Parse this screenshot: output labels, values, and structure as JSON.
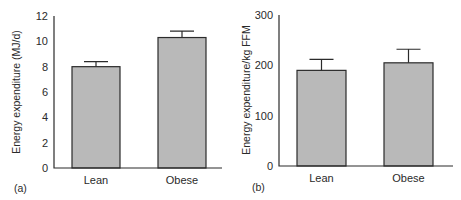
{
  "chart_data": [
    {
      "type": "bar",
      "panel_label": "(a)",
      "title": "",
      "xlabel": "",
      "ylabel": "Energy expenditure (MJ/d)",
      "categories": [
        "Lean",
        "Obese"
      ],
      "values": [
        8.0,
        10.3
      ],
      "error_upper": [
        8.4,
        10.8
      ],
      "ylim": [
        0,
        12
      ],
      "yticks": [
        0,
        2,
        4,
        6,
        8,
        10,
        12
      ],
      "grid": false,
      "legend": null
    },
    {
      "type": "bar",
      "panel_label": "(b)",
      "title": "",
      "xlabel": "",
      "ylabel": "Energy expenditure/kg FFM",
      "categories": [
        "Lean",
        "Obese"
      ],
      "values": [
        190,
        205
      ],
      "error_upper": [
        212,
        232
      ],
      "ylim": [
        0,
        300
      ],
      "yticks": [
        0,
        100,
        200,
        300
      ],
      "grid": false,
      "legend": null
    }
  ],
  "colors": {
    "bar_fill": "#b9b9b9",
    "bar_stroke": "#2b2b2b",
    "axis": "#2b2b2b",
    "text": "#2a2a2a"
  }
}
